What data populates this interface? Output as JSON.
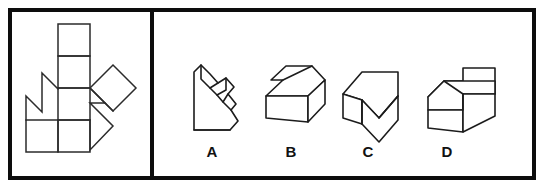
{
  "figure": {
    "panels": {
      "left_label": "unfolded-net-panel",
      "right_label": "answer-options-panel"
    },
    "frame": {
      "border_color": "#0d0d0d",
      "border_width": 4,
      "divider_x": 152,
      "background": "#ffffff"
    },
    "line_color": "#2b2b2b",
    "solid_line_color": "#1c1c1c",
    "label_color": "#111111"
  },
  "stimulus": {
    "name": "unfolded-net",
    "description": "Unfolded net made of axis-aligned squares in a vertical column with a zigzag flap on the left and two rotated (45 degree) squares with an arrow notch on the right",
    "net_paths": [
      "M 58 24 L 90 24 L 90 56 L 58 56 Z",
      "M 58 56 L 90 56 L 90 88 L 58 88 Z",
      "M 58 88 L 90 88 L 90 120 L 58 120 Z",
      "M 58 120 L 90 120 L 90 152 L 58 152 Z",
      "M 26 120 L 58 120 L 58 152 L 26 152 Z",
      "M 26 120 L 26 97 L 42 113 L 42 74 L 58 90 L 58 120 Z",
      "M 58 88 L 90 88 L 105 103 L 90 103 L 113 126 L 90 150 L 58 120 Z",
      "M 90 88 L 113 65 L 136 88 L 113 111 Z",
      "M 105 103 L 113 111"
    ]
  },
  "options": [
    {
      "id": "A",
      "name": "option-a",
      "label": "A",
      "label_x": 212,
      "label_y": 152,
      "description": "Tall wedge solid with an angled notched ridge running diagonally down its right face"
    },
    {
      "id": "B",
      "name": "option-b",
      "label": "B",
      "label_x": 291,
      "label_y": 152,
      "description": "Low rectangular block seen from above with a small triangular notch cut into the top-left of its upper face"
    },
    {
      "id": "C",
      "name": "option-c",
      "label": "C",
      "label_x": 368,
      "label_y": 152,
      "description": "Block with a deep V shaped vertical groove cut through the front, forming two sloping inner walls"
    },
    {
      "id": "D",
      "name": "option-d",
      "label": "D",
      "label_x": 447,
      "label_y": 152,
      "description": "Rectangular block whose top face has a flat step or flange with a triangular cut at the rear left"
    }
  ]
}
